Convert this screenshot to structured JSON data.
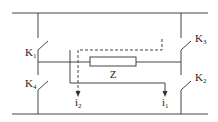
{
  "diagram": {
    "type": "H-bridge circuit",
    "switches": [
      {
        "id": "k1",
        "label": "K",
        "sub": "1"
      },
      {
        "id": "k2",
        "label": "K",
        "sub": "2"
      },
      {
        "id": "k3",
        "label": "K",
        "sub": "3"
      },
      {
        "id": "k4",
        "label": "K",
        "sub": "4"
      }
    ],
    "load": {
      "label": "Z"
    },
    "currents": [
      {
        "id": "i1",
        "label": "i",
        "sub": "1",
        "path": "solid"
      },
      {
        "id": "i2",
        "label": "i",
        "sub": "2",
        "path": "dashed"
      }
    ],
    "colors": {
      "line": "#444444",
      "text": "#222222",
      "background": "#ffffff"
    }
  }
}
